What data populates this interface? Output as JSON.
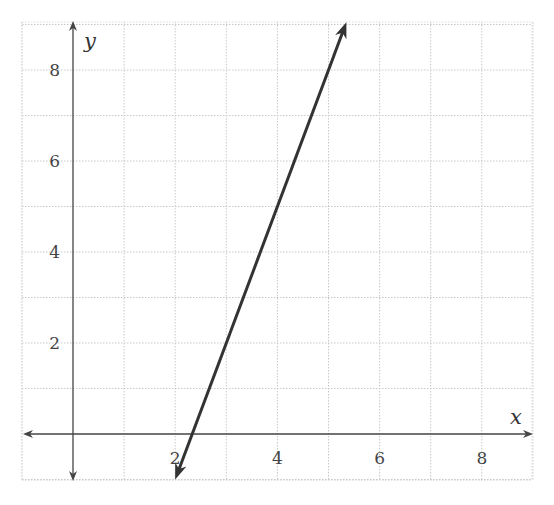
{
  "chart_data": {
    "type": "line",
    "title": "",
    "xlabel": "x",
    "ylabel": "y",
    "xlim": [
      -1,
      9
    ],
    "ylim": [
      -1,
      9
    ],
    "grid": true,
    "grid_step": 1,
    "x_ticks": [
      2,
      4,
      6,
      8
    ],
    "y_ticks": [
      2,
      4,
      6,
      8
    ],
    "x_tick_labels": [
      "2",
      "4",
      "6",
      "8"
    ],
    "y_tick_labels": [
      "2",
      "4",
      "6",
      "8"
    ],
    "series": [
      {
        "name": "line",
        "equation": "y = 3x - 7",
        "slope": 3,
        "intercept": -7,
        "x": [
          2,
          2.333,
          3,
          4,
          5,
          5.35
        ],
        "y": [
          -1,
          0,
          2,
          5,
          8,
          9.05
        ],
        "arrows": "both",
        "color": "#333333"
      }
    ],
    "legend": null
  },
  "colors": {
    "grid": "#c8c8c8",
    "axis": "#444444",
    "line": "#333333"
  }
}
